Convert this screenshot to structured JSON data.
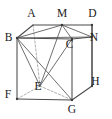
{
  "figure": {
    "type": "geometry-diagram",
    "shape": "cube",
    "background_color": "#ffffff",
    "line_color": "#4a4a4a",
    "hidden_line_color": "#9a9a9a",
    "label_color": "#1a1a1a",
    "width": 112,
    "height": 119
  },
  "vertices": [
    {
      "id": "A",
      "label": "A",
      "x": 33.0,
      "y": 25.0,
      "label_x": 31.5,
      "label_y": 14.0,
      "hidden": true,
      "anchor": "middle"
    },
    {
      "id": "M",
      "label": "M",
      "x": 62.0,
      "y": 25.0,
      "label_x": 62.0,
      "label_y": 14.0,
      "hidden": false,
      "anchor": "middle"
    },
    {
      "id": "D",
      "label": "D",
      "x": 92.0,
      "y": 25.0,
      "label_x": 92.5,
      "label_y": 14.0,
      "hidden": false,
      "anchor": "middle"
    },
    {
      "id": "B",
      "label": "B",
      "x": 17.0,
      "y": 38.0,
      "label_x": 8.5,
      "label_y": 38.0,
      "hidden": false,
      "anchor": "middle"
    },
    {
      "id": "C",
      "label": "C",
      "x": 72.0,
      "y": 39.0,
      "label_x": 69.5,
      "label_y": 45.5,
      "hidden": false,
      "anchor": "middle"
    },
    {
      "id": "N",
      "label": "N",
      "x": 92.0,
      "y": 37.0,
      "label_x": 94.0,
      "label_y": 38.5,
      "hidden": false,
      "anchor": "middle"
    },
    {
      "id": "E",
      "label": "E",
      "x": 40.0,
      "y": 86.0,
      "label_x": 38.0,
      "label_y": 87.5,
      "hidden": true,
      "anchor": "middle"
    },
    {
      "id": "F",
      "label": "F",
      "x": 17.0,
      "y": 99.0,
      "label_x": 8.0,
      "label_y": 95.5,
      "hidden": false,
      "anchor": "middle"
    },
    {
      "id": "G",
      "label": "G",
      "x": 72.0,
      "y": 100.0,
      "label_x": 72.0,
      "label_y": 110.0,
      "hidden": false,
      "anchor": "middle"
    },
    {
      "id": "H",
      "label": "H",
      "x": 92.0,
      "y": 86.0,
      "label_x": 95.5,
      "label_y": 82.0,
      "hidden": false,
      "anchor": "middle"
    }
  ],
  "edges_solid": [
    {
      "from": "B",
      "to": "A"
    },
    {
      "from": "A",
      "to": "M"
    },
    {
      "from": "M",
      "to": "D"
    },
    {
      "from": "D",
      "to": "N"
    },
    {
      "from": "B",
      "to": "C"
    },
    {
      "from": "C",
      "to": "N"
    },
    {
      "from": "N",
      "to": "H"
    },
    {
      "from": "C",
      "to": "G"
    },
    {
      "from": "B",
      "to": "F"
    },
    {
      "from": "F",
      "to": "G"
    },
    {
      "from": "G",
      "to": "H"
    },
    {
      "from": "D",
      "to": "H"
    }
  ],
  "edges_hidden": [
    {
      "from": "A",
      "to": "E"
    },
    {
      "from": "E",
      "to": "F"
    },
    {
      "from": "E",
      "to": "G"
    }
  ],
  "edges_construction": [
    {
      "from": "B",
      "to": "M"
    },
    {
      "from": "B",
      "to": "N"
    },
    {
      "from": "M",
      "to": "N"
    },
    {
      "from": "M",
      "to": "C"
    },
    {
      "from": "B",
      "to": "G"
    },
    {
      "from": "B",
      "to": "E"
    },
    {
      "from": "E",
      "to": "C"
    },
    {
      "from": "M",
      "to": "E"
    }
  ],
  "labels_text": {
    "A": "A",
    "M": "M",
    "D": "D",
    "B": "B",
    "C": "C",
    "N": "N",
    "E": "E",
    "F": "F",
    "G": "G",
    "H": "H"
  }
}
